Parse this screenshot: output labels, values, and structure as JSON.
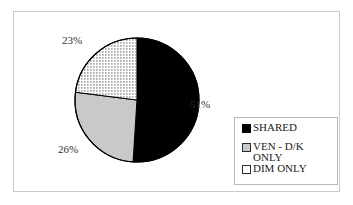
{
  "chart_data": {
    "type": "pie",
    "title": "",
    "subtitle": "",
    "xlabel": "",
    "ylabel": "",
    "legend_position": "right-bottom",
    "grid": false,
    "start_angle_deg": 0,
    "direction": "clockwise",
    "categories": [
      "SHARED",
      "VEN - D/K ONLY",
      "DIM ONLY"
    ],
    "values": [
      51,
      26,
      23
    ],
    "value_unit": "%",
    "data_labels": [
      "51%",
      "23%",
      "26%"
    ],
    "slices": [
      {
        "label": "SHARED",
        "value": 51,
        "display": "51%",
        "fill": "#000000",
        "fill_style": "solid",
        "stroke": "#000000",
        "start_deg": 0,
        "sweep_deg": 183.6
      },
      {
        "label": "VEN - D/K ONLY",
        "value": 26,
        "display": "26%",
        "fill": "#c9c9c9",
        "fill_style": "solid",
        "stroke": "#000000",
        "start_deg": 183.6,
        "sweep_deg": 93.6
      },
      {
        "label": "DIM ONLY",
        "value": 23,
        "display": "23%",
        "fill": "#ffffff",
        "fill_style": "dotted",
        "stroke": "#000000",
        "start_deg": 277.2,
        "sweep_deg": 82.8
      }
    ]
  },
  "labels": {
    "shared_pct": "51%",
    "dim_pct": "23%",
    "ven_pct": "26%"
  },
  "legend": {
    "entries": [
      {
        "label": "SHARED",
        "swatch": "solid-black-swatch"
      },
      {
        "label": "VEN - D/K\nONLY",
        "swatch": "gray-swatch"
      },
      {
        "label": "DIM ONLY",
        "swatch": "dotted-swatch"
      }
    ]
  },
  "colors": {
    "shared": "#000000",
    "ven": "#c9c9c9",
    "dim": "#ffffff",
    "outline": "#000000",
    "frame": "#c9c9c9",
    "legend_border": "#b9b9b9",
    "label_text": "#303030",
    "legend_text": "#1a1a1a"
  }
}
